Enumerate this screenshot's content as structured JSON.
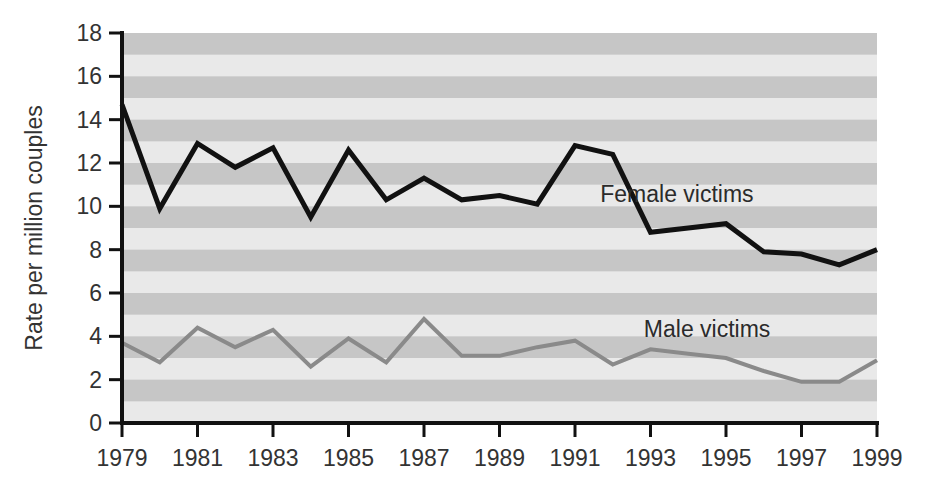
{
  "chart_data": {
    "type": "line",
    "title": "",
    "xlabel": "",
    "ylabel": "Rate per million couples",
    "xlim": [
      1979,
      1999
    ],
    "ylim": [
      0,
      18
    ],
    "ytick_step": 2,
    "xtick_step": 2,
    "grid": "horizontal-alternating-bands",
    "legend_position": "inline-right",
    "x": [
      1979,
      1980,
      1981,
      1982,
      1983,
      1984,
      1985,
      1986,
      1987,
      1988,
      1989,
      1990,
      1991,
      1992,
      1993,
      1994,
      1995,
      1996,
      1997,
      1998,
      1999
    ],
    "xticks": [
      "1979",
      "1981",
      "1983",
      "1985",
      "1987",
      "1989",
      "1991",
      "1993",
      "1995",
      "1997",
      "1999"
    ],
    "xtick_values": [
      1979,
      1981,
      1983,
      1985,
      1987,
      1989,
      1991,
      1993,
      1995,
      1997,
      1999
    ],
    "yticks": [
      "0",
      "2",
      "4",
      "6",
      "8",
      "10",
      "12",
      "14",
      "16",
      "18"
    ],
    "ytick_values": [
      0,
      2,
      4,
      6,
      8,
      10,
      12,
      14,
      16,
      18
    ],
    "series": [
      {
        "name": "Female victims",
        "color": "#111111",
        "width": 5,
        "label_x": 1993.7,
        "label_y": 10.2,
        "values": [
          14.7,
          9.9,
          12.9,
          11.8,
          12.7,
          9.5,
          12.6,
          10.3,
          11.3,
          10.3,
          10.5,
          10.1,
          12.8,
          12.4,
          8.8,
          9.0,
          9.2,
          7.9,
          7.8,
          7.3,
          8.0
        ]
      },
      {
        "name": "Male victims",
        "color": "#8a8a8a",
        "width": 4,
        "label_x": 1994.5,
        "label_y": 3.95,
        "values": [
          3.7,
          2.8,
          4.4,
          3.5,
          4.3,
          2.6,
          3.9,
          2.8,
          4.8,
          3.1,
          3.1,
          3.5,
          3.8,
          2.7,
          3.4,
          3.2,
          3.0,
          2.4,
          1.9,
          1.9,
          2.9
        ]
      }
    ],
    "colors": {
      "band_light": "#e9e9e9",
      "band_dark": "#c6c6c6",
      "axis": "#111111",
      "text": "#333333"
    }
  }
}
